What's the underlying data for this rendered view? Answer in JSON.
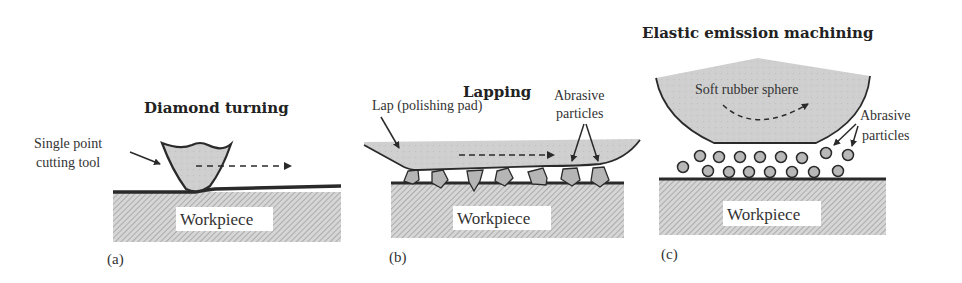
{
  "figure": {
    "panels": [
      {
        "id": "a",
        "panel_label": "(a)",
        "title": "Diamond turning",
        "tool_label_line1": "Single point",
        "tool_label_line2": "cutting tool",
        "workpiece_label": "Workpiece"
      },
      {
        "id": "b",
        "panel_label": "(b)",
        "title": "Lapping",
        "lap_label": "Lap (polishing pad)",
        "abrasive_label_line1": "Abrasive",
        "abrasive_label_line2": "particles",
        "workpiece_label": "Workpiece"
      },
      {
        "id": "c",
        "panel_label": "(c)",
        "title": "Elastic emission machining",
        "sphere_label": "Soft rubber sphere",
        "abrasive_label_line1": "Abrasive",
        "abrasive_label_line2": "particles",
        "workpiece_label": "Workpiece"
      }
    ],
    "colors": {
      "tool_fill": "#c8c8c8",
      "hatch_bg": "#d4d4d4",
      "hatch_line": "#9a9a9a",
      "outline": "#2a2a2a"
    }
  }
}
